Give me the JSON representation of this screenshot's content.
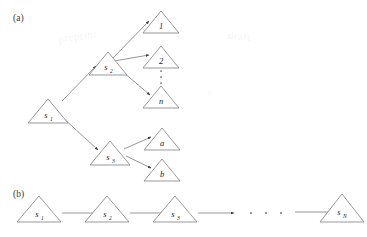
{
  "figure": {
    "panels": [
      {
        "id": "panel-a",
        "label": "(a)",
        "label_x": 13,
        "label_y": 21,
        "type": "tree",
        "nodes": [
          {
            "id": "s1",
            "base": "s",
            "sub": "1",
            "cx": 48,
            "cy": 111,
            "w": 40,
            "h": 24
          },
          {
            "id": "s2",
            "base": "s",
            "sub": "2",
            "cx": 108,
            "cy": 64,
            "w": 38,
            "h": 23
          },
          {
            "id": "s3",
            "base": "s",
            "sub": "3",
            "cx": 110,
            "cy": 153,
            "w": 40,
            "h": 24
          },
          {
            "id": "n1",
            "base": "1",
            "sub": "",
            "cx": 161,
            "cy": 22,
            "w": 36,
            "h": 22
          },
          {
            "id": "n2",
            "base": "2",
            "sub": "",
            "cx": 161,
            "cy": 57,
            "w": 36,
            "h": 22
          },
          {
            "id": "nn",
            "base": "n",
            "sub": "",
            "cx": 161,
            "cy": 97,
            "w": 36,
            "h": 22
          },
          {
            "id": "na",
            "base": "a",
            "sub": "",
            "cx": 162,
            "cy": 139,
            "w": 36,
            "h": 22
          },
          {
            "id": "nb",
            "base": "b",
            "sub": "",
            "cx": 162,
            "cy": 170,
            "w": 36,
            "h": 22
          }
        ],
        "edges": [
          {
            "from": "s1",
            "to": "s2",
            "x1": 62,
            "y1": 101,
            "x2": 96,
            "y2": 66
          },
          {
            "from": "s1",
            "to": "s3",
            "x1": 62,
            "y1": 117,
            "x2": 98,
            "y2": 150
          },
          {
            "from": "s2",
            "to": "n1",
            "x1": 113,
            "y1": 58,
            "x2": 149,
            "y2": 21
          },
          {
            "from": "s2",
            "to": "n2",
            "x1": 114,
            "y1": 61,
            "x2": 149,
            "y2": 55
          },
          {
            "from": "s2",
            "to": "nn",
            "x1": 116,
            "y1": 66,
            "x2": 150,
            "y2": 95
          },
          {
            "from": "s3",
            "to": "na",
            "x1": 124,
            "y1": 149,
            "x2": 151,
            "y2": 137
          },
          {
            "from": "s3",
            "to": "nb",
            "x1": 126,
            "y1": 156,
            "x2": 151,
            "y2": 168
          }
        ],
        "vertical_dots": {
          "x": 161,
          "ys": [
            70,
            76,
            82
          ]
        }
      },
      {
        "id": "panel-b",
        "label": "(b)",
        "label_x": 13,
        "label_y": 197,
        "type": "chain",
        "nodes": [
          {
            "id": "b1",
            "base": "s",
            "sub": "1",
            "cx": 39,
            "cy": 219,
            "w": 44,
            "h": 26
          },
          {
            "id": "b2",
            "base": "s",
            "sub": "2",
            "cx": 107,
            "cy": 219,
            "w": 44,
            "h": 26
          },
          {
            "id": "b3",
            "base": "s",
            "sub": "3",
            "cx": 175,
            "cy": 219,
            "w": 44,
            "h": 26
          },
          {
            "id": "bN",
            "base": "s",
            "sub": "N",
            "cx": 342,
            "cy": 216,
            "w": 44,
            "h": 28
          }
        ],
        "edges": [
          {
            "from": "b1",
            "to": "b2",
            "x1": 62,
            "y1": 213,
            "x2": 96,
            "y2": 213
          },
          {
            "from": "b2",
            "to": "b3",
            "x1": 130,
            "y1": 213,
            "x2": 164,
            "y2": 213
          },
          {
            "from": "b3",
            "to": "dots",
            "x1": 198,
            "y1": 213,
            "x2": 232,
            "y2": 213
          },
          {
            "from": "dots",
            "to": "bN",
            "x1": 295,
            "y1": 212,
            "x2": 331,
            "y2": 212
          }
        ],
        "horizontal_dots": {
          "y": 213,
          "xs": [
            251,
            266,
            281
          ]
        }
      }
    ],
    "watermarks": [
      {
        "text": "preprint",
        "x": 58,
        "y": 38,
        "rotate": -8
      },
      {
        "text": "draft",
        "x": 228,
        "y": 38,
        "rotate": 6
      },
      {
        "text": "v",
        "x": 208,
        "y": 95,
        "rotate": 0
      }
    ],
    "colors": {
      "stroke": "#6e6e6e",
      "text": "#262626",
      "background": "#ffffff",
      "arrow": "#3d3d3d"
    }
  }
}
